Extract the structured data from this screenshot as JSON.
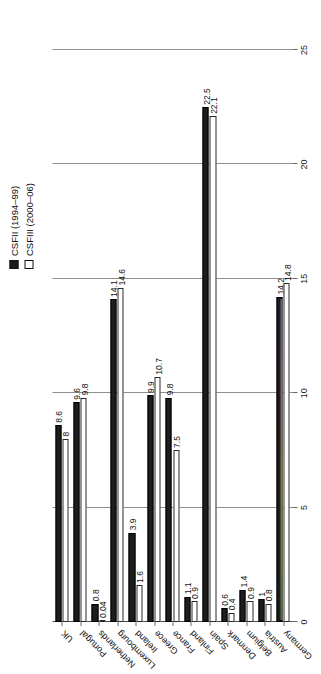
{
  "chart_data": {
    "type": "bar",
    "orientation": "horizontal",
    "title": "",
    "subtitle": "",
    "xlabel": "",
    "ylabel": "",
    "xlim": [
      0,
      25
    ],
    "grid": true,
    "legend_position": "top-right",
    "axis_ticks": [
      "0",
      "5",
      "10",
      "15",
      "20",
      "25"
    ],
    "axis_tick_values": [
      0,
      5,
      10,
      15,
      20,
      25
    ],
    "categories": [
      "Germany",
      "Austria",
      "Belgium",
      "Denmark",
      "Spain",
      "Finland",
      "France",
      "Greece",
      "Ireland",
      "Luxembourg",
      "Netherlands",
      "Portugal",
      "UK"
    ],
    "series": [
      {
        "name": "CSFII (1994–99)",
        "color": "#1d1d1d",
        "style": "filled",
        "values": [
          14.2,
          1,
          1.4,
          0.6,
          22.5,
          1.1,
          9.8,
          9.9,
          3.9,
          14.1,
          0.8,
          9.6,
          8.6
        ],
        "labels": [
          "14.2",
          "1",
          "1.4",
          "0.6",
          "22.5",
          "1.1",
          "9.8",
          "9.9",
          "3.9",
          "14.1",
          "0.8",
          "9.6",
          "8.6"
        ]
      },
      {
        "name": "CSFIII (2000–06)",
        "color": "#ffffff",
        "style": "hollow",
        "values": [
          14.8,
          0.8,
          0.9,
          0.4,
          22.1,
          0.9,
          7.5,
          10.7,
          1.6,
          14.6,
          0.04,
          9.8,
          8
        ],
        "labels": [
          "14.8",
          "0.8",
          "0.9",
          "0.4",
          "22.1",
          "0.9",
          "7.5",
          "10.7",
          "1.6",
          "14.6",
          "0.04",
          "9.8",
          "8"
        ]
      }
    ]
  },
  "legend": {
    "items": [
      {
        "label": "CSFII (1994–99)",
        "swatch": "filled-square-icon"
      },
      {
        "label": "CSFIII (2000–06)",
        "swatch": "hollow-square-icon"
      }
    ]
  }
}
